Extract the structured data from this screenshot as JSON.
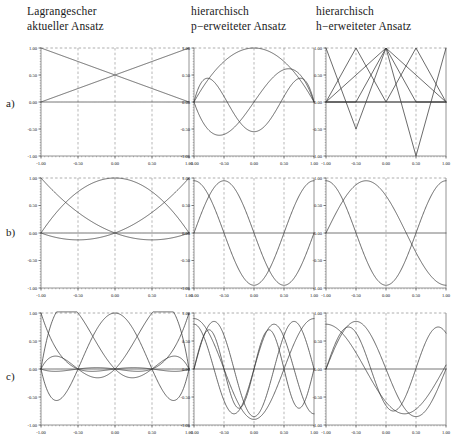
{
  "figure": {
    "columns": [
      {
        "id": "lagrange",
        "line1": "Lagrangescher",
        "line2": "aktueller Ansatz"
      },
      {
        "id": "p-extended",
        "line1": "hierarchisch",
        "line2": "p−erweiteter Ansatz"
      },
      {
        "id": "h-extended",
        "line1": "hierarchisch",
        "line2": "h−erweiteter Ansatz"
      }
    ],
    "rows": [
      {
        "id": "a",
        "label": "a)"
      },
      {
        "id": "b",
        "label": "b)"
      },
      {
        "id": "c",
        "label": "c)"
      }
    ],
    "axis": {
      "xticks": [
        "-1.00",
        "-0.50",
        "0.00",
        "0.50",
        "1.00"
      ],
      "yticks": [
        "1.00",
        "0.50",
        "0.00",
        "-0.50",
        "-1.00"
      ],
      "xlim": [
        -1,
        1
      ],
      "ylim": [
        -1,
        1
      ],
      "grid": true,
      "grid_style": "dashed",
      "curve_color": "#3a3a3a",
      "frame_color": "#888888",
      "grid_color": "#9a9a9a"
    }
  },
  "chart_data": [
    {
      "id": "a-lagrange",
      "type": "line",
      "title": "Lagrangescher aktueller Ansatz — a)",
      "xlabel": "",
      "ylabel": "",
      "xlim": [
        -1,
        1
      ],
      "ylim": [
        -1,
        1
      ],
      "xticks": [
        -1,
        -0.5,
        0,
        0.5,
        1
      ],
      "yticks": [
        -1,
        -0.5,
        0,
        0.5,
        1
      ],
      "grid": true,
      "series": [
        {
          "name": "N1 linear descending",
          "kind": "poly",
          "expr": "0.5*(1-x)"
        },
        {
          "name": "N2 linear ascending",
          "kind": "poly",
          "expr": "0.5*(1+x)"
        },
        {
          "name": "zero baseline",
          "kind": "poly",
          "expr": "0"
        }
      ]
    },
    {
      "id": "a-p-extended",
      "type": "line",
      "title": "hierarchisch p−erweiteter Ansatz — a)",
      "xlim": [
        -1,
        1
      ],
      "ylim": [
        -1,
        1
      ],
      "xticks": [
        -1,
        -0.5,
        0,
        0.5,
        1
      ],
      "yticks": [
        -1,
        -0.5,
        0,
        0.5,
        1
      ],
      "grid": true,
      "series": [
        {
          "name": "bubble mode 2",
          "kind": "poly",
          "expr": "1-x*x"
        },
        {
          "name": "bubble mode 3",
          "kind": "poly",
          "expr": "x*(1-x*x)*1.6"
        },
        {
          "name": "bubble mode 4",
          "kind": "poly",
          "expr": "(1-x*x)*(5*x*x-1)*0.55"
        },
        {
          "name": "zero baseline",
          "kind": "poly",
          "expr": "0"
        }
      ]
    },
    {
      "id": "a-h-extended",
      "type": "line",
      "title": "hierarchisch h−erweiteter Ansatz — a)",
      "xlim": [
        -1,
        1
      ],
      "ylim": [
        -1,
        1
      ],
      "xticks": [
        -1,
        -0.5,
        0,
        0.5,
        1
      ],
      "yticks": [
        -1,
        -0.5,
        0,
        0.5,
        1
      ],
      "grid": true,
      "series": [
        {
          "name": "hat at -0.5",
          "kind": "hat",
          "nodes": [
            [
              -1,
              0
            ],
            [
              -0.5,
              1
            ],
            [
              0,
              0
            ],
            [
              1,
              0
            ]
          ]
        },
        {
          "name": "hat at 0",
          "kind": "hat",
          "nodes": [
            [
              -1,
              0
            ],
            [
              -0.5,
              0
            ],
            [
              0,
              1
            ],
            [
              0.5,
              0
            ],
            [
              1,
              0
            ]
          ]
        },
        {
          "name": "hat at 0.5",
          "kind": "hat",
          "nodes": [
            [
              -1,
              0
            ],
            [
              0,
              0
            ],
            [
              0.5,
              1
            ],
            [
              1,
              0
            ]
          ]
        },
        {
          "name": "V at -0.5",
          "kind": "hat",
          "nodes": [
            [
              -1,
              1
            ],
            [
              -0.5,
              -0.5
            ],
            [
              0,
              1
            ],
            [
              1,
              0
            ]
          ]
        },
        {
          "name": "V at 0.5",
          "kind": "hat",
          "nodes": [
            [
              -1,
              0
            ],
            [
              0,
              1
            ],
            [
              0.5,
              -1
            ],
            [
              1,
              1
            ]
          ]
        },
        {
          "name": "zero baseline",
          "kind": "hat",
          "nodes": [
            [
              -1,
              0
            ],
            [
              1,
              0
            ]
          ]
        }
      ]
    },
    {
      "id": "b-lagrange",
      "type": "line",
      "title": "Lagrangescher aktueller Ansatz — b)",
      "xlim": [
        -1,
        1
      ],
      "ylim": [
        -1,
        1
      ],
      "xticks": [
        -1,
        -0.5,
        0,
        0.5,
        1
      ],
      "yticks": [
        -1,
        -0.5,
        0,
        0.5,
        1
      ],
      "grid": true,
      "series": [
        {
          "name": "quad N1",
          "kind": "poly",
          "expr": "0.5*x*(x-1)"
        },
        {
          "name": "quad N2",
          "kind": "poly",
          "expr": "1-x*x"
        },
        {
          "name": "quad N3",
          "kind": "poly",
          "expr": "0.5*x*(x+1)"
        },
        {
          "name": "zero baseline",
          "kind": "poly",
          "expr": "0"
        }
      ]
    },
    {
      "id": "b-p-extended",
      "type": "line",
      "title": "hierarchisch p−erweiteter Ansatz — b)",
      "xlim": [
        -1,
        1
      ],
      "ylim": [
        -1,
        1
      ],
      "xticks": [
        -1,
        -0.5,
        0,
        0.5,
        1
      ],
      "yticks": [
        -1,
        -0.5,
        0,
        0.5,
        1
      ],
      "grid": true,
      "series": [
        {
          "name": "mode 4",
          "kind": "poly",
          "expr": "Math.cos(3.1416*(x+1))*0.95"
        },
        {
          "name": "mode 5",
          "kind": "poly",
          "expr": "Math.sin(3.1416*(x+1))*0.95"
        },
        {
          "name": "zero baseline",
          "kind": "poly",
          "expr": "0"
        }
      ]
    },
    {
      "id": "b-h-extended",
      "type": "line",
      "title": "hierarchisch h−erweiteter Ansatz — b)",
      "xlim": [
        -1,
        1
      ],
      "ylim": [
        -1,
        1
      ],
      "xticks": [
        -1,
        -0.5,
        0,
        0.5,
        1
      ],
      "yticks": [
        -1,
        -0.5,
        0,
        0.5,
        1
      ],
      "grid": true,
      "series": [
        {
          "name": "cos mode",
          "kind": "poly",
          "expr": "Math.cos(3.1416*(x+1))*0.95"
        },
        {
          "name": "sin-like mode",
          "kind": "poly",
          "expr": "Math.sin(2.35*(x+1))*0.95"
        },
        {
          "name": "zero baseline",
          "kind": "poly",
          "expr": "0"
        }
      ]
    },
    {
      "id": "c-lagrange",
      "type": "line",
      "title": "Lagrangescher aktueller Ansatz — c)",
      "xlim": [
        -1,
        1
      ],
      "ylim": [
        -1,
        1
      ],
      "xticks": [
        -1,
        -0.5,
        0,
        0.5,
        1
      ],
      "yticks": [
        -1,
        -0.5,
        0,
        0.5,
        1
      ],
      "grid": true,
      "series": [
        {
          "name": "quartic L1",
          "kind": "lagrange",
          "nodes": [
            -1,
            -0.5,
            0,
            0.5,
            1
          ],
          "index": 0
        },
        {
          "name": "quartic L2",
          "kind": "lagrange",
          "nodes": [
            -1,
            -0.5,
            0,
            0.5,
            1
          ],
          "index": 1
        },
        {
          "name": "quartic L3",
          "kind": "lagrange",
          "nodes": [
            -1,
            -0.5,
            0,
            0.5,
            1
          ],
          "index": 2
        },
        {
          "name": "quartic L4",
          "kind": "lagrange",
          "nodes": [
            -1,
            -0.5,
            0,
            0.5,
            1
          ],
          "index": 3
        },
        {
          "name": "quartic L5",
          "kind": "lagrange",
          "nodes": [
            -1,
            -0.5,
            0,
            0.5,
            1
          ],
          "index": 4
        },
        {
          "name": "zero baseline",
          "kind": "poly",
          "expr": "0"
        }
      ]
    },
    {
      "id": "c-p-extended",
      "type": "line",
      "title": "hierarchisch p−erweiteter Ansatz — c)",
      "xlim": [
        -1,
        1
      ],
      "ylim": [
        -1,
        1
      ],
      "xticks": [
        -1,
        -0.5,
        0,
        0.5,
        1
      ],
      "yticks": [
        -1,
        -0.5,
        0,
        0.5,
        1
      ],
      "grid": true,
      "series": [
        {
          "name": "mode 6",
          "kind": "poly",
          "expr": "Math.cos(3.1416*(x+1))*0.9"
        },
        {
          "name": "mode 7",
          "kind": "poly",
          "expr": "Math.sin(4.712*(x+1))*0.85"
        },
        {
          "name": "mode 8",
          "kind": "poly",
          "expr": "Math.cos(4.712*(x+1))*0.8"
        },
        {
          "name": "mode 9",
          "kind": "poly",
          "expr": "Math.sin(6.283*(x+1))*0.7"
        },
        {
          "name": "zero baseline",
          "kind": "poly",
          "expr": "0"
        }
      ]
    },
    {
      "id": "c-h-extended",
      "type": "line",
      "title": "hierarchisch h−erweiteter Ansatz — c)",
      "xlim": [
        -1,
        1
      ],
      "ylim": [
        -1,
        1
      ],
      "xticks": [
        -1,
        -0.5,
        0,
        0.5,
        1
      ],
      "yticks": [
        -1,
        -0.5,
        0,
        0.5,
        1
      ],
      "grid": true,
      "series": [
        {
          "name": "mode A",
          "kind": "poly",
          "expr": "Math.sin(3.1416*(x+1))*0.85"
        },
        {
          "name": "mode B",
          "kind": "poly",
          "expr": "Math.cos(2.4*(x+1))*0.8"
        },
        {
          "name": "mode C",
          "kind": "poly",
          "expr": "Math.sin(4.2*(x+1))*0.75"
        },
        {
          "name": "zero baseline",
          "kind": "poly",
          "expr": "0"
        }
      ]
    }
  ]
}
